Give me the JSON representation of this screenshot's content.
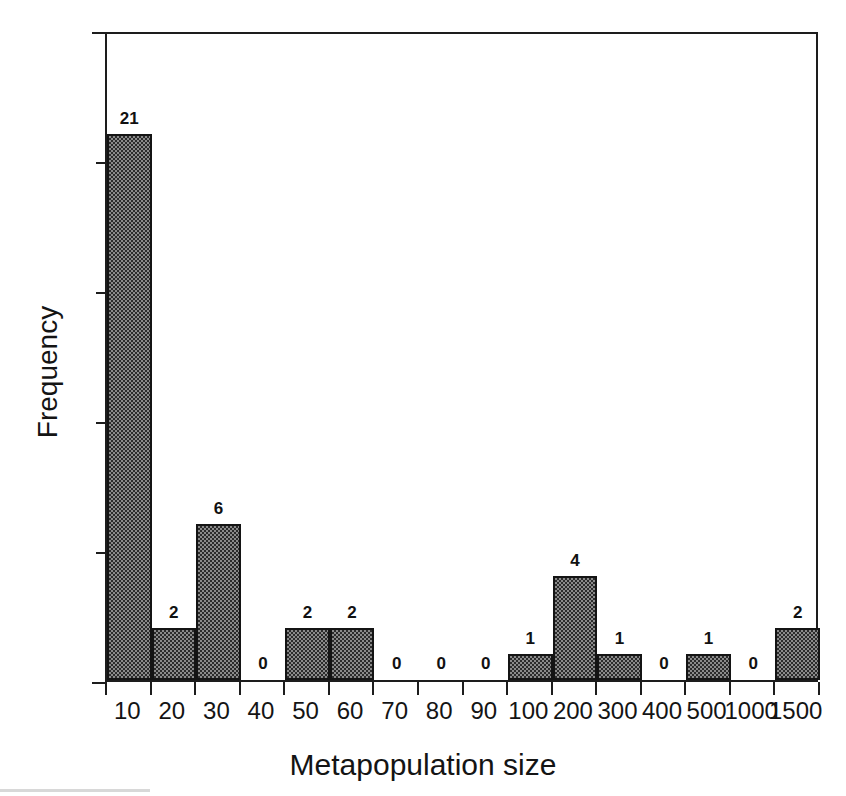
{
  "chart_data": {
    "type": "bar",
    "title": "",
    "subtitle": "",
    "xlabel": "Metapopulation size",
    "ylabel": "Frequency",
    "categories": [
      "10",
      "20",
      "30",
      "40",
      "50",
      "60",
      "70",
      "80",
      "90",
      "100",
      "200",
      "300",
      "400",
      "500",
      "1000",
      "1500"
    ],
    "values": [
      21,
      2,
      6,
      0,
      2,
      2,
      0,
      0,
      0,
      1,
      4,
      1,
      0,
      1,
      0,
      2
    ],
    "bar_labels": [
      "21",
      "2",
      "6",
      "0",
      "2",
      "2",
      "0",
      "0",
      "0",
      "1",
      "4",
      "1",
      "0",
      "1",
      "0",
      "2"
    ],
    "ylim": [
      0,
      25
    ],
    "yticks": [
      0,
      5,
      10,
      15,
      20,
      25
    ],
    "ytick_labels": [
      "0",
      "5",
      "10",
      "15",
      "20",
      "25"
    ],
    "xtick_labels": [
      "10",
      "20",
      "30",
      "40",
      "50",
      "60",
      "70",
      "80",
      "90",
      "100",
      "200",
      "300",
      "400",
      "500",
      "1000",
      "1500"
    ],
    "grid": false,
    "legend": null,
    "bar_style": "hatched-gray-fill-black-outline",
    "colors": {
      "bar_fill": "#8a8a8a",
      "bar_hatch": "#2b2b2b",
      "bar_outline": "#141414",
      "axis": "#1d1d1d",
      "text": "#141414",
      "background": "#ffffff"
    }
  }
}
